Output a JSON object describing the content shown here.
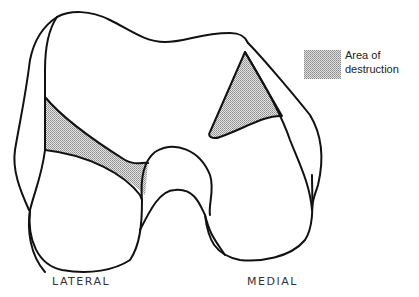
{
  "diagram": {
    "legend": {
      "swatch_pattern": "stippled-gray",
      "line1": "Area of",
      "line2": "destruction"
    },
    "labels": {
      "lateral": "LATERAL",
      "medial": "MEDIAL"
    },
    "colors": {
      "outline": "#111111",
      "stipple": "#b8b8b8",
      "background": "#ffffff"
    }
  }
}
